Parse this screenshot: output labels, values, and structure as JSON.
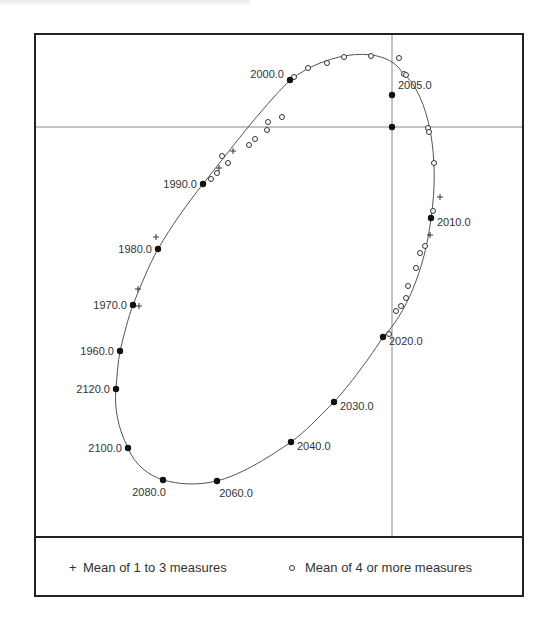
{
  "chart_data": {
    "type": "scatter",
    "title": "",
    "xlabel": "",
    "ylabel": "",
    "grid": false,
    "crosshair": {
      "x": 392,
      "y": 127
    },
    "curve": "ellipse fitted through yearly positions",
    "labeled_points": [
      {
        "label": "1960.0",
        "x": 120,
        "y": 351,
        "label_side": "left"
      },
      {
        "label": "1970.0",
        "x": 133,
        "y": 305,
        "label_side": "left"
      },
      {
        "label": "1980.0",
        "x": 158,
        "y": 249,
        "label_side": "left"
      },
      {
        "label": "1990.0",
        "x": 203,
        "y": 184,
        "label_side": "left"
      },
      {
        "label": "2000.0",
        "x": 290,
        "y": 80,
        "label_side": "left"
      },
      {
        "label": "2005.0",
        "x": 392,
        "y": 95,
        "label_side": "right"
      },
      {
        "label": "2010.0",
        "x": 431,
        "y": 218,
        "label_side": "right"
      },
      {
        "label": "2020.0",
        "x": 383,
        "y": 337,
        "label_side": "right"
      },
      {
        "label": "2030.0",
        "x": 334,
        "y": 402,
        "label_side": "right"
      },
      {
        "label": "2040.0",
        "x": 291,
        "y": 442,
        "label_side": "right"
      },
      {
        "label": "2060.0",
        "x": 217,
        "y": 481,
        "label_side": "below"
      },
      {
        "label": "2080.0",
        "x": 163,
        "y": 480,
        "label_side": "below"
      },
      {
        "label": "2100.0",
        "x": 128,
        "y": 448,
        "label_side": "left"
      },
      {
        "label": "2120.0",
        "x": 116,
        "y": 389,
        "label_side": "left"
      }
    ],
    "center_point": {
      "x": 392,
      "y": 127
    },
    "series": [
      {
        "name": "Mean of 1 to 3 measures",
        "marker": "plus",
        "points": [
          [
            156,
            237
          ],
          [
            138,
            289
          ],
          [
            139,
            306
          ],
          [
            233,
            151
          ],
          [
            219,
            168
          ],
          [
            440,
            197
          ],
          [
            430,
            235
          ]
        ]
      },
      {
        "name": "Mean of 4 or more measures",
        "marker": "open-circle",
        "points": [
          [
            222,
            156
          ],
          [
            228,
            163
          ],
          [
            211,
            179
          ],
          [
            217,
            173
          ],
          [
            249,
            145
          ],
          [
            255,
            139
          ],
          [
            267,
            130
          ],
          [
            268,
            122
          ],
          [
            282,
            117
          ],
          [
            294,
            77
          ],
          [
            308,
            68
          ],
          [
            327,
            63
          ],
          [
            344,
            57
          ],
          [
            371,
            56
          ],
          [
            399,
            58
          ],
          [
            404,
            74
          ],
          [
            406,
            75
          ],
          [
            428,
            128
          ],
          [
            429,
            132
          ],
          [
            434,
            163
          ],
          [
            433,
            211
          ],
          [
            425,
            246
          ],
          [
            420,
            253
          ],
          [
            416,
            268
          ],
          [
            408,
            286
          ],
          [
            406,
            298
          ],
          [
            401,
            306
          ],
          [
            396,
            311
          ],
          [
            389,
            334
          ]
        ]
      }
    ],
    "legend": {
      "position": "bottom",
      "entries": [
        {
          "symbol": "+",
          "label": "Mean of 1 to 3 measures"
        },
        {
          "symbol": "○",
          "label": "Mean of 4 or more measures"
        }
      ]
    }
  }
}
